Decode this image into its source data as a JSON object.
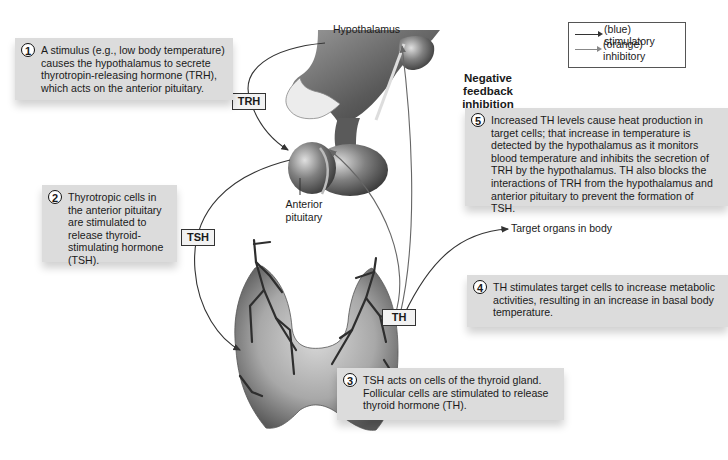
{
  "diagram": {
    "legend": {
      "items": [
        {
          "label": "(blue) stimulatory",
          "color": "#333333"
        },
        {
          "label": "(orange) inhibitory",
          "color": "#888888"
        }
      ]
    },
    "structures": {
      "hypothalamus": "Hypothalamus",
      "anterior_pituitary": "Anterior\npituitary",
      "target_organs": "Target organs in body"
    },
    "hormone_labels": {
      "trh": "TRH",
      "tsh": "TSH",
      "th": "TH"
    },
    "feedback_label": "Negative feedback inhibition",
    "steps": [
      {
        "number": "1",
        "text": "A stimulus (e.g., low body temperature) causes the hypothalamus to secrete thyrotropin-releasing hormone (TRH), which acts on the anterior pituitary."
      },
      {
        "number": "2",
        "text": "Thyrotropic cells in the anterior pituitary are stimulated to release thyroid-stimulating hormone (TSH)."
      },
      {
        "number": "3",
        "text": "TSH acts on cells of the thyroid gland. Follicular cells are stimulated to release thyroid hormone (TH)."
      },
      {
        "number": "4",
        "text": "TH stimulates target cells to increase metabolic activities, resulting in an increase in basal body temperature."
      },
      {
        "number": "5",
        "text": "Increased TH levels cause heat production in target cells; that increase in temperature is detected by the hypothalamus as it monitors blood temperature and inhibits the secretion of TRH by the hypothalamus.  TH also blocks the interactions of TRH from the hypothalamus and anterior pituitary to prevent the formation of TSH."
      }
    ]
  }
}
